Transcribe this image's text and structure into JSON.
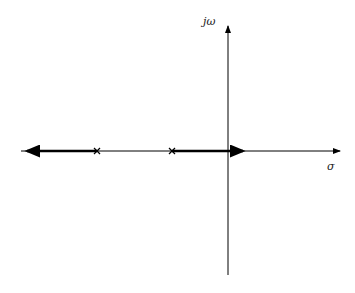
{
  "diagram": {
    "type": "root-locus",
    "axes": {
      "real_axis_label": "σ",
      "imag_axis_label": "jω"
    },
    "poles": [
      {
        "marker": "×",
        "x": 97,
        "y": 151
      },
      {
        "marker": "×",
        "x": 172,
        "y": 151
      }
    ],
    "branches": [
      {
        "from": "pole-1",
        "direction": "left",
        "to_x": 21
      },
      {
        "from": "pole-2",
        "direction": "right",
        "to_x": 249
      }
    ],
    "colors": {
      "axis": "#000000",
      "locus": "#000000"
    }
  }
}
